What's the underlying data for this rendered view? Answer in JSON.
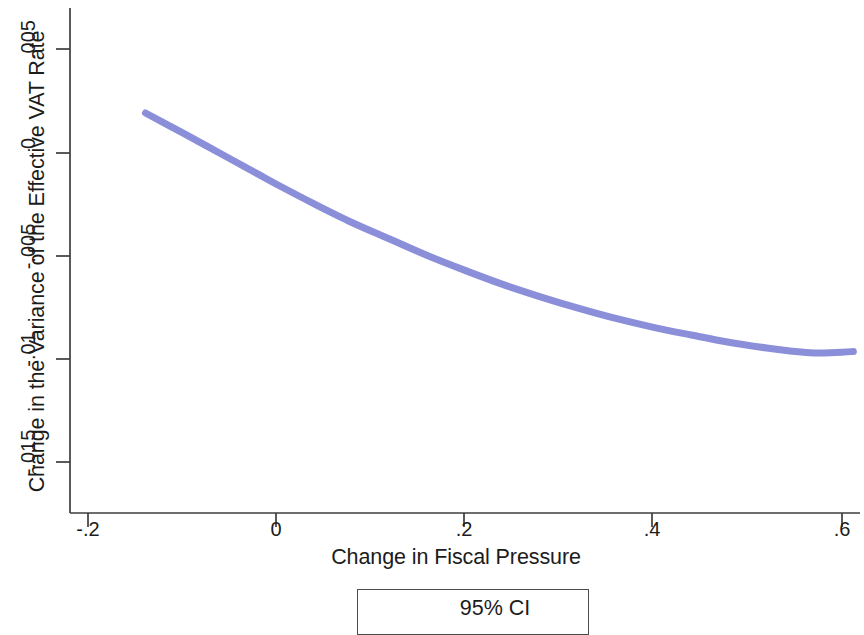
{
  "chart_data": {
    "type": "line",
    "title": "",
    "subtitle": "",
    "xlabel": "Change in Fiscal Pressure",
    "ylabel": "Change in the Variance of the Effective VAT Rate",
    "xlim": [
      -0.2,
      0.62
    ],
    "ylim": [
      -0.0168,
      0.0062
    ],
    "xticks": [
      -0.2,
      0,
      0.2,
      0.4,
      0.6
    ],
    "xticklabels": [
      "-.2",
      "0",
      ".2",
      ".4",
      ".6"
    ],
    "yticks": [
      0.005,
      0,
      -0.005,
      -0.01,
      -0.015
    ],
    "yticklabels": [
      ".005",
      "0",
      "-.005",
      "-.01",
      "-.015"
    ],
    "grid": false,
    "legend_position": "below-axes",
    "legend": [
      "95% CI"
    ],
    "series": [
      {
        "name": "95% CI",
        "color": "#8186d6",
        "linewidth_px": 7,
        "x": [
          -0.139,
          -0.1,
          -0.06,
          -0.02,
          0.0,
          0.04,
          0.08,
          0.12,
          0.16,
          0.2,
          0.24,
          0.28,
          0.32,
          0.36,
          0.4,
          0.44,
          0.48,
          0.52,
          0.545,
          0.57,
          0.6,
          0.612
        ],
        "y": [
          0.0019,
          0.00095,
          -5e-05,
          -0.00105,
          -0.00155,
          -0.0025,
          -0.0034,
          -0.0042,
          -0.005,
          -0.00572,
          -0.0064,
          -0.007,
          -0.00755,
          -0.00805,
          -0.00848,
          -0.00885,
          -0.0092,
          -0.00948,
          -0.00962,
          -0.00972,
          -0.00968,
          -0.00965
        ]
      }
    ]
  },
  "axes": {
    "y_title": "Change in the Variance of the Effective VAT Rate",
    "x_title": "Change in Fiscal Pressure",
    "y_tick_labels": [
      ".005",
      "0",
      "-.005",
      "-.01",
      "-.015"
    ],
    "x_tick_labels": [
      "-.2",
      "0",
      ".2",
      ".4",
      ".6"
    ]
  },
  "legend": {
    "ci_label": "95% CI"
  },
  "colors": {
    "line": "#8186d6",
    "axis": "#3d3d3d",
    "text": "#1c1c1c"
  }
}
